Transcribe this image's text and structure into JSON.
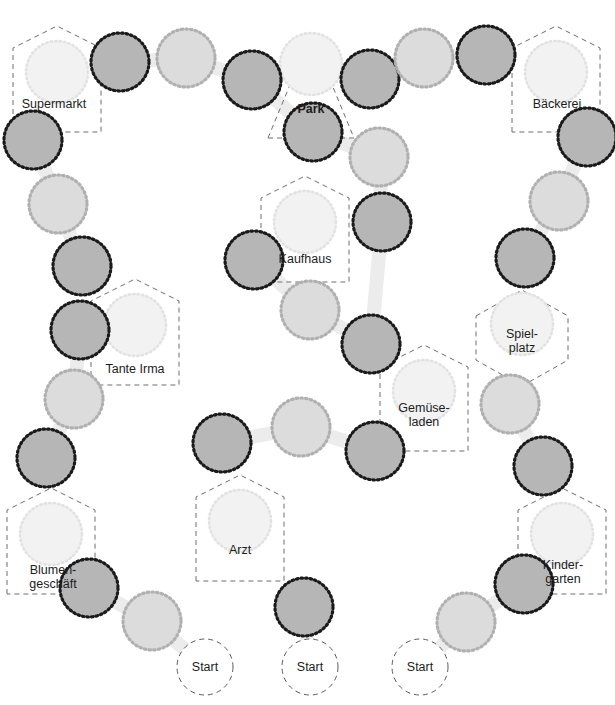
{
  "board": {
    "title": "Stadtplan Spielbrett",
    "width": 615,
    "height": 705,
    "background": "#ffffff",
    "colors": {
      "dark_node_fill": "#b6b6b6",
      "dark_node_border": "#1a1a1a",
      "light_node_fill": "#dcdcdc",
      "light_node_border": "#b0b0b0",
      "place_node_fill": "#f2f2f2",
      "place_node_border": "#e2e2e2",
      "dashed_outline": "#6e6e6e",
      "path": "#ececec",
      "text": "#1c1c1c"
    }
  },
  "places": [
    {
      "id": "supermarkt",
      "label": "Supermarkt",
      "shape": "house",
      "cx": 57,
      "cy": 72,
      "label_x": 54,
      "label_y": 104,
      "bold": false
    },
    {
      "id": "park",
      "label": "Park",
      "shape": "triangle",
      "cx": 311,
      "cy": 64,
      "label_x": 311,
      "label_y": 109,
      "bold": true
    },
    {
      "id": "baeckerei",
      "label": "Bäckerei",
      "shape": "house",
      "cx": 556,
      "cy": 72,
      "label_x": 557,
      "label_y": 104,
      "bold": false
    },
    {
      "id": "kaufhaus",
      "label": "Kaufhaus",
      "shape": "house",
      "cx": 305,
      "cy": 222,
      "label_x": 305,
      "label_y": 259,
      "bold": false
    },
    {
      "id": "spielplatz",
      "label": "Spiel-\nplatz",
      "shape": "hexagon",
      "cx": 522,
      "cy": 324,
      "label_x": 522,
      "label_y": 341,
      "bold": false
    },
    {
      "id": "tante-irma",
      "label": "Tante Irma",
      "shape": "house",
      "cx": 135,
      "cy": 325,
      "label_x": 135,
      "label_y": 369,
      "bold": false
    },
    {
      "id": "gemueseladen",
      "label": "Gemüse-\nladen",
      "shape": "house",
      "cx": 424,
      "cy": 391,
      "label_x": 424,
      "label_y": 415,
      "bold": false
    },
    {
      "id": "arzt",
      "label": "Arzt",
      "shape": "house",
      "cx": 240,
      "cy": 521,
      "label_x": 240,
      "label_y": 550,
      "bold": false
    },
    {
      "id": "blumengeschaeft",
      "label": "Blumen-\ngeschäft",
      "shape": "house",
      "cx": 51,
      "cy": 534,
      "label_x": 53,
      "label_y": 577,
      "bold": false
    },
    {
      "id": "kindergarten",
      "label": "Kinder-\ngarten",
      "shape": "house",
      "cx": 562,
      "cy": 534,
      "label_x": 563,
      "label_y": 572,
      "bold": false
    }
  ],
  "start_nodes": [
    {
      "id": "start-1",
      "label": "Start",
      "cx": 205,
      "cy": 667
    },
    {
      "id": "start-2",
      "label": "Start",
      "cx": 310,
      "cy": 667
    },
    {
      "id": "start-3",
      "label": "Start",
      "cx": 420,
      "cy": 667
    }
  ],
  "path_nodes": [
    {
      "id": "n1",
      "cx": 120,
      "cy": 62,
      "tone": "dark"
    },
    {
      "id": "n2",
      "cx": 186,
      "cy": 58,
      "tone": "light"
    },
    {
      "id": "n3",
      "cx": 252,
      "cy": 80,
      "tone": "dark"
    },
    {
      "id": "n4",
      "cx": 370,
      "cy": 79,
      "tone": "dark"
    },
    {
      "id": "n5",
      "cx": 424,
      "cy": 58,
      "tone": "light"
    },
    {
      "id": "n6",
      "cx": 486,
      "cy": 55,
      "tone": "dark"
    },
    {
      "id": "n7",
      "cx": 313,
      "cy": 132,
      "tone": "dark"
    },
    {
      "id": "n8",
      "cx": 379,
      "cy": 157,
      "tone": "light"
    },
    {
      "id": "n9",
      "cx": 382,
      "cy": 222,
      "tone": "dark"
    },
    {
      "id": "n10",
      "cx": 33,
      "cy": 140,
      "tone": "dark"
    },
    {
      "id": "n11",
      "cx": 58,
      "cy": 204,
      "tone": "light"
    },
    {
      "id": "n12",
      "cx": 82,
      "cy": 266,
      "tone": "dark"
    },
    {
      "id": "n13",
      "cx": 587,
      "cy": 137,
      "tone": "dark"
    },
    {
      "id": "n14",
      "cx": 559,
      "cy": 201,
      "tone": "light"
    },
    {
      "id": "n15",
      "cx": 525,
      "cy": 258,
      "tone": "dark"
    },
    {
      "id": "n16",
      "cx": 254,
      "cy": 260,
      "tone": "dark"
    },
    {
      "id": "n17",
      "cx": 310,
      "cy": 310,
      "tone": "light"
    },
    {
      "id": "n18",
      "cx": 371,
      "cy": 344,
      "tone": "dark"
    },
    {
      "id": "n19",
      "cx": 510,
      "cy": 404,
      "tone": "light"
    },
    {
      "id": "n20",
      "cx": 543,
      "cy": 466,
      "tone": "dark"
    },
    {
      "id": "n21",
      "cx": 80,
      "cy": 330,
      "tone": "dark"
    },
    {
      "id": "n22",
      "cx": 74,
      "cy": 399,
      "tone": "light"
    },
    {
      "id": "n23",
      "cx": 46,
      "cy": 458,
      "tone": "dark"
    },
    {
      "id": "n24",
      "cx": 222,
      "cy": 443,
      "tone": "dark"
    },
    {
      "id": "n25",
      "cx": 301,
      "cy": 427,
      "tone": "light"
    },
    {
      "id": "n26",
      "cx": 375,
      "cy": 451,
      "tone": "dark"
    },
    {
      "id": "n27",
      "cx": 89,
      "cy": 588,
      "tone": "dark"
    },
    {
      "id": "n28",
      "cx": 152,
      "cy": 621,
      "tone": "light"
    },
    {
      "id": "n29",
      "cx": 304,
      "cy": 607,
      "tone": "dark"
    },
    {
      "id": "n30",
      "cx": 466,
      "cy": 622,
      "tone": "light"
    },
    {
      "id": "n31",
      "cx": 524,
      "cy": 584,
      "tone": "dark"
    }
  ],
  "paths": [
    [
      "n1",
      "n2"
    ],
    [
      "n2",
      "n3"
    ],
    [
      "n4",
      "n5"
    ],
    [
      "n5",
      "n6"
    ],
    [
      "n3",
      "n7"
    ],
    [
      "n7",
      "n8"
    ],
    [
      "n8",
      "n9"
    ],
    [
      "n10",
      "n11"
    ],
    [
      "n11",
      "n12"
    ],
    [
      "n13",
      "n14"
    ],
    [
      "n14",
      "n15"
    ],
    [
      "n16",
      "n17"
    ],
    [
      "n17",
      "n18"
    ],
    [
      "n9",
      "n18"
    ],
    [
      "n19",
      "n20"
    ],
    [
      "n21",
      "n22"
    ],
    [
      "n22",
      "n23"
    ],
    [
      "n24",
      "n25"
    ],
    [
      "n25",
      "n26"
    ],
    [
      "n27",
      "n28"
    ],
    [
      "n28",
      "start-1"
    ],
    [
      "n29",
      "start-2"
    ],
    [
      "n30",
      "n31"
    ],
    [
      "start-3",
      "n30"
    ]
  ]
}
